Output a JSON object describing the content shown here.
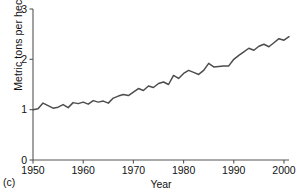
{
  "figure": {
    "panel_label": "(c)",
    "line_color": "#4d4d4d",
    "axis_color": "#555555",
    "background": "#ffffff"
  },
  "chart_data": {
    "type": "line",
    "title": "",
    "subtitle": "",
    "xlabel": "Year",
    "ylabel": "Metric tons per hectare",
    "xlim": [
      1950,
      2001
    ],
    "ylim": [
      0,
      3
    ],
    "xticks": [
      1950,
      1960,
      1970,
      1980,
      1990,
      2000
    ],
    "xtick_labels": [
      "1950",
      "1960",
      "1970",
      "1980",
      "1990",
      "2000"
    ],
    "yticks": [
      0,
      1,
      2,
      3
    ],
    "ytick_labels": [
      "0",
      "1",
      "2",
      "3"
    ],
    "grid": false,
    "legend": null,
    "annotations": [],
    "series": [
      {
        "name": "Cereal yield",
        "x": [
          1950,
          1951,
          1952,
          1953,
          1954,
          1955,
          1956,
          1957,
          1958,
          1959,
          1960,
          1961,
          1962,
          1963,
          1964,
          1965,
          1966,
          1967,
          1968,
          1969,
          1970,
          1971,
          1972,
          1973,
          1974,
          1975,
          1976,
          1977,
          1978,
          1979,
          1980,
          1981,
          1982,
          1983,
          1984,
          1985,
          1986,
          1987,
          1988,
          1989,
          1990,
          1991,
          1992,
          1993,
          1994,
          1995,
          1996,
          1997,
          1998,
          1999,
          2000,
          2001
        ],
        "values": [
          1.0,
          1.02,
          1.13,
          1.08,
          1.03,
          1.05,
          1.1,
          1.04,
          1.14,
          1.12,
          1.15,
          1.11,
          1.18,
          1.15,
          1.17,
          1.13,
          1.23,
          1.27,
          1.3,
          1.28,
          1.35,
          1.42,
          1.38,
          1.47,
          1.44,
          1.52,
          1.55,
          1.5,
          1.68,
          1.62,
          1.72,
          1.78,
          1.74,
          1.7,
          1.78,
          1.92,
          1.85,
          1.86,
          1.87,
          1.87,
          2.0,
          2.08,
          2.15,
          2.22,
          2.18,
          2.26,
          2.3,
          2.25,
          2.33,
          2.41,
          2.38,
          2.45
        ]
      }
    ]
  }
}
